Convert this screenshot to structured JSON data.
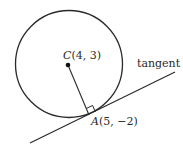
{
  "diagram": {
    "center": {
      "name": "C",
      "coords": "(4, 3)"
    },
    "point": {
      "name": "A",
      "coords": "(5, −2)"
    },
    "tangent_label": "tangent",
    "colors": {
      "stroke": "#2a2a2a",
      "background": "#ffffff"
    }
  }
}
